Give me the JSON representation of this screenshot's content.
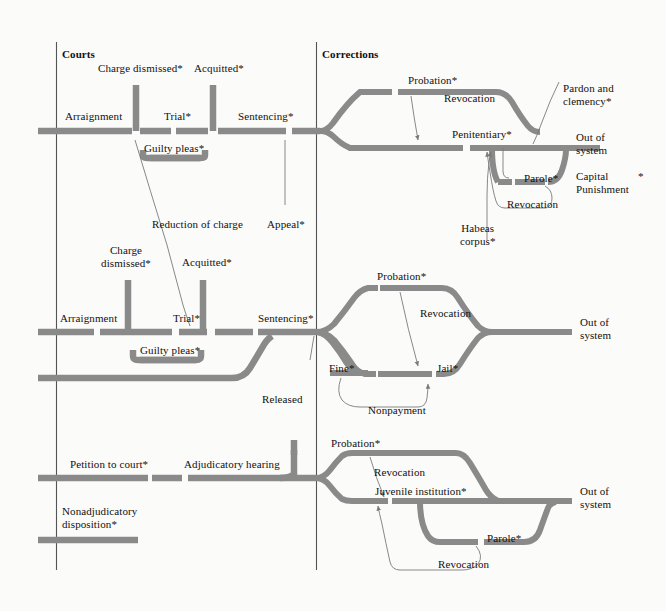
{
  "figure": {
    "sections": [
      {
        "id": "courts",
        "label": "Courts"
      },
      {
        "id": "corrections",
        "label": "Corrections"
      }
    ],
    "colors": {
      "flow_band": "#8a8a8a",
      "thin_line": "#7a7a7a",
      "divider": "#555555",
      "text": "#111111",
      "background": "#fbfbfa"
    }
  },
  "tracks": {
    "felony": {
      "name": "Felony track",
      "courts_stages": [
        {
          "id": "arraignment",
          "label": "Arraignment"
        },
        {
          "id": "trial",
          "label": "Trial*"
        },
        {
          "id": "sentencing",
          "label": "Sentencing*"
        },
        {
          "id": "guilty-pleas",
          "label": "Guilty pleas*"
        }
      ],
      "courts_exits": [
        {
          "id": "charge-dismissed",
          "label": "Charge dismissed*"
        },
        {
          "id": "acquitted",
          "label": "Acquitted*"
        }
      ],
      "corrections_stages": [
        {
          "id": "probation",
          "label": "Probation*"
        },
        {
          "id": "penitentiary",
          "label": "Penitentiary*"
        },
        {
          "id": "parole",
          "label": "Parole*"
        }
      ],
      "corrections_transitions": [
        {
          "id": "revocation-probation",
          "label": "Revocation"
        },
        {
          "id": "revocation-parole",
          "label": "Revocation"
        },
        {
          "id": "habeas-corpus",
          "label": "Habeas\ncorpus*"
        },
        {
          "id": "pardon-clemency",
          "label": "Pardon and\nclemency*"
        },
        {
          "id": "capital-punishment",
          "label": "Capital\nPunishment"
        },
        {
          "id": "capital-punishment-asterisk",
          "label": "*"
        }
      ],
      "exit": {
        "id": "out-of-system-felony",
        "label": "Out of\nsystem"
      }
    },
    "misdemeanor": {
      "name": "Misdemeanor track",
      "courts_stages": [
        {
          "id": "arraignment",
          "label": "Arraignment"
        },
        {
          "id": "trial",
          "label": "Trial*"
        },
        {
          "id": "sentencing",
          "label": "Sentencing*"
        },
        {
          "id": "guilty-pleas",
          "label": "Guilty pleas*"
        }
      ],
      "courts_exits": [
        {
          "id": "charge-dismissed",
          "label": "Charge\ndismissed*"
        },
        {
          "id": "acquitted",
          "label": "Acquitted*"
        }
      ],
      "cross_track": [
        {
          "id": "reduction-of-charge",
          "label": "Reduction of charge"
        },
        {
          "id": "appeal",
          "label": "Appeal*"
        }
      ],
      "corrections_stages": [
        {
          "id": "probation",
          "label": "Probation*"
        },
        {
          "id": "fine",
          "label": "Fine*"
        },
        {
          "id": "jail",
          "label": "Jail*"
        }
      ],
      "corrections_transitions": [
        {
          "id": "revocation",
          "label": "Revocation"
        },
        {
          "id": "nonpayment",
          "label": "Nonpayment"
        }
      ],
      "exit": {
        "id": "out-of-system-misdemeanor",
        "label": "Out of\nsystem"
      }
    },
    "juvenile": {
      "name": "Juvenile track",
      "courts_stages": [
        {
          "id": "petition-to-court",
          "label": "Petition to court*"
        },
        {
          "id": "adjudicatory-hearing",
          "label": "Adjudicatory hearing"
        },
        {
          "id": "nonadjudicatory",
          "label": "Nonadjudicatory\ndisposition*"
        }
      ],
      "courts_exits": [
        {
          "id": "released",
          "label": "Released"
        }
      ],
      "corrections_stages": [
        {
          "id": "probation",
          "label": "Probation*"
        },
        {
          "id": "juvenile-institution",
          "label": "Juvenile institution*"
        },
        {
          "id": "parole",
          "label": "Parole*"
        }
      ],
      "corrections_transitions": [
        {
          "id": "revocation-probation",
          "label": "Revocation"
        },
        {
          "id": "revocation-parole",
          "label": "Revocation"
        }
      ],
      "exit": {
        "id": "out-of-system-juvenile",
        "label": "Out of\nsystem"
      }
    }
  }
}
